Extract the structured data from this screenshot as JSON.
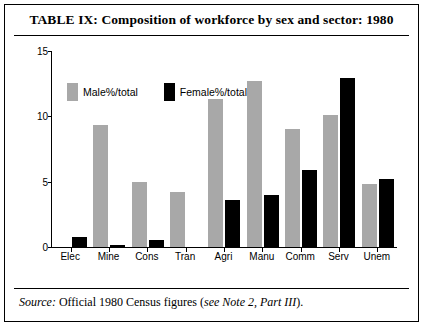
{
  "title": "TABLE IX: Composition of workforce by sex and sector: 1980",
  "source": {
    "prefix": "Source:",
    "text": "Official 1980 Census figures (",
    "italic_ref": "see Note 2, Part III",
    "suffix": ")."
  },
  "colors": {
    "male": "#a8a8a8",
    "female": "#000000",
    "frame": "#000000",
    "background": "#ffffff"
  },
  "chart_data": {
    "type": "bar",
    "title": "TABLE IX: Composition of workforce by sex and sector: 1980",
    "xlabel": "",
    "ylabel": "",
    "ylim": [
      0,
      15
    ],
    "yticks": [
      0,
      5,
      10,
      15
    ],
    "grid": false,
    "legend_position": "top-left",
    "categories": [
      "Elec",
      "Mine",
      "Cons",
      "Tran",
      "Agri",
      "Manu",
      "Comm",
      "Serv",
      "Unem"
    ],
    "series": [
      {
        "name": "Male%/total",
        "values": [
          0,
          9.3,
          5.0,
          4.2,
          11.3,
          12.7,
          9.0,
          10.1,
          4.8
        ]
      },
      {
        "name": "Female%/total",
        "values": [
          0.75,
          0.15,
          0.55,
          0,
          3.6,
          4.0,
          5.9,
          12.9,
          5.2
        ]
      }
    ]
  }
}
